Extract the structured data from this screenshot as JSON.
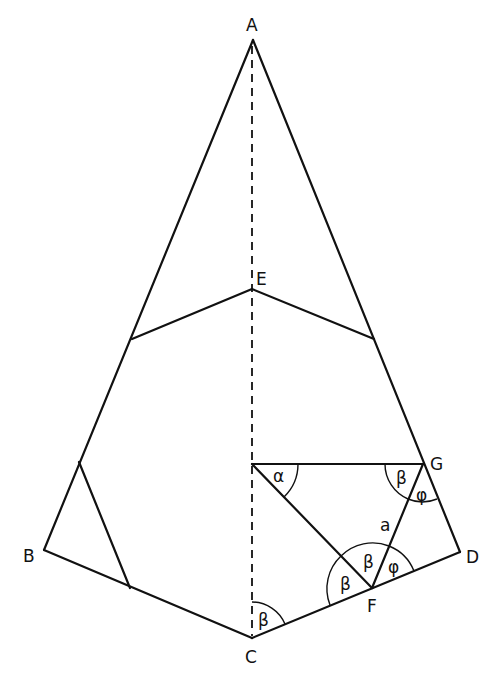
{
  "diagram": {
    "type": "geometry-construction",
    "points": {
      "A": {
        "label": "A",
        "x": 253,
        "y": 40
      },
      "B": {
        "label": "B",
        "x": 44,
        "y": 550
      },
      "C": {
        "label": "C",
        "x": 252,
        "y": 638
      },
      "D": {
        "label": "D",
        "x": 460,
        "y": 552
      },
      "E": {
        "label": "E",
        "x": 252,
        "y": 289
      },
      "F": {
        "label": "F",
        "x": 372,
        "y": 588
      },
      "G": {
        "label": "G",
        "x": 423,
        "y": 464
      }
    },
    "angle_labels": {
      "alpha": "α",
      "beta_G": "β",
      "phi_G": "φ",
      "beta_F_left": "β",
      "beta_F_mid": "β",
      "phi_F": "φ",
      "beta_C": "β"
    },
    "segment_labels": {
      "FG": "a"
    },
    "colors": {
      "stroke": "#111111",
      "background": "#ffffff"
    }
  }
}
